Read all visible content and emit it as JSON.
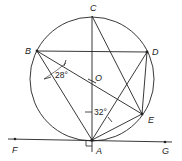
{
  "diagram": {
    "title": "",
    "points": {
      "A": {
        "label": "A",
        "x": 92,
        "y": 140
      },
      "B": {
        "label": "B",
        "x": 37,
        "y": 51
      },
      "C": {
        "label": "C",
        "x": 92,
        "y": 16
      },
      "D": {
        "label": "D",
        "x": 147,
        "y": 52
      },
      "E": {
        "label": "E",
        "x": 142,
        "y": 114
      },
      "F": {
        "label": "F",
        "x": 15,
        "y": 139
      },
      "G": {
        "label": "G",
        "x": 165,
        "y": 142
      },
      "O": {
        "label": "O",
        "x": 92,
        "y": 79
      }
    },
    "circle": {
      "center": "O",
      "radius": 62
    },
    "angles": {
      "angle_B": {
        "label": "28°"
      },
      "angle_A": {
        "label": "32°"
      }
    },
    "segments": [
      "BD",
      "BA",
      "BE",
      "CA",
      "CE",
      "DA",
      "DE",
      "EA",
      "FG"
    ],
    "right_angle_at": "A",
    "line_color": "#222222"
  }
}
